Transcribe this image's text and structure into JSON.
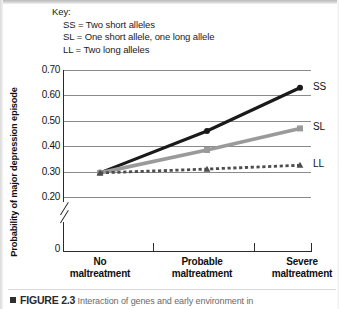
{
  "figure": {
    "key_title": "Key:",
    "key_items": [
      {
        "code": "SS",
        "eq": "=",
        "desc": "Two short alleles"
      },
      {
        "code": "SL",
        "eq": "=",
        "desc": "One short allele, one long allele"
      },
      {
        "code": "LL",
        "eq": "=",
        "desc": "Two long alleles"
      }
    ],
    "caption_marker": "square-bullet",
    "caption_figure_number": "FIGURE 2.3",
    "caption_text": "Interaction of genes and early environment in"
  },
  "chart_data": {
    "type": "line",
    "title": "",
    "xlabel": "",
    "ylabel": "Probability of major depression episode",
    "categories": [
      "No maltreatment",
      "Probable maltreatment",
      "Severe maltreatment"
    ],
    "ylim": [
      0.2,
      0.7
    ],
    "yticks": [
      "0.70",
      "0.60",
      "0.50",
      "0.40",
      "0.30",
      "0.20"
    ],
    "ytick_values": [
      0.7,
      0.6,
      0.5,
      0.4,
      0.3,
      0.2
    ],
    "y_origin_label": "0",
    "axis_break": true,
    "grid": true,
    "legend_position": "right-of-line-end",
    "series": [
      {
        "name": "SS",
        "label": "SS",
        "values": [
          0.295,
          0.46,
          0.63
        ],
        "color": "#1a1a1a",
        "style": "solid",
        "marker": "circle"
      },
      {
        "name": "SL",
        "label": "SL",
        "values": [
          0.295,
          0.385,
          0.47
        ],
        "color": "#9a9a9a",
        "style": "solid",
        "marker": "square"
      },
      {
        "name": "LL",
        "label": "LL",
        "values": [
          0.295,
          0.31,
          0.325
        ],
        "color": "#4d4d4d",
        "style": "dotted",
        "marker": "triangle"
      }
    ]
  }
}
